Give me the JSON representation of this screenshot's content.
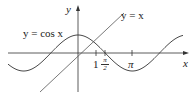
{
  "diagram": {
    "axes": {
      "x_label": "x",
      "y_label": "y"
    },
    "curves": [
      {
        "name": "cosine",
        "label": "y = cos x"
      },
      {
        "name": "identity-line",
        "label": "y = x"
      }
    ],
    "ticks": {
      "one": "1",
      "half_pi_num": "π",
      "half_pi_den": "2",
      "pi": "π"
    },
    "colors": {
      "curve": "#2b2b2b",
      "axis": "#2b2b2b"
    }
  }
}
